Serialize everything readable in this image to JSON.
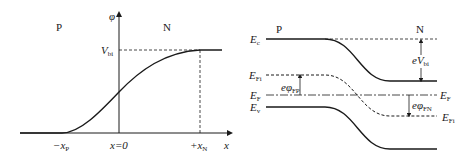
{
  "left_panel": {
    "region_p": "P",
    "region_n": "N",
    "y_axis_label": "φ",
    "x_axis_label": "x",
    "vbi_label": {
      "main": "V",
      "sub": "bi"
    },
    "tick_minus_xp": {
      "prefix": "−x",
      "sub": "P"
    },
    "tick_zero": "x=0",
    "tick_plus_xn": {
      "prefix": "+x",
      "sub": "N"
    }
  },
  "right_panel": {
    "region_p": "P",
    "region_n": "N",
    "ec_label": {
      "main": "E",
      "sub": "c"
    },
    "efi_left_label": {
      "main": "E",
      "sub": "Fi"
    },
    "ef_left_label": {
      "main": "E",
      "sub": "F"
    },
    "ev_label": {
      "main": "E",
      "sub": "v"
    },
    "ef_right_label": {
      "main": "E",
      "sub": "F"
    },
    "efi_right_label": {
      "main": "E",
      "sub": "Fi"
    },
    "evbi_label": {
      "main": "eV",
      "sub": "bi"
    },
    "ephi_fp_label": {
      "main": "eφ",
      "sub": "FP"
    },
    "ephi_fn_label": {
      "main": "eφ",
      "sub": "FN"
    }
  },
  "colors": {
    "line": "#1a1a1a",
    "background": "#ffffff"
  }
}
